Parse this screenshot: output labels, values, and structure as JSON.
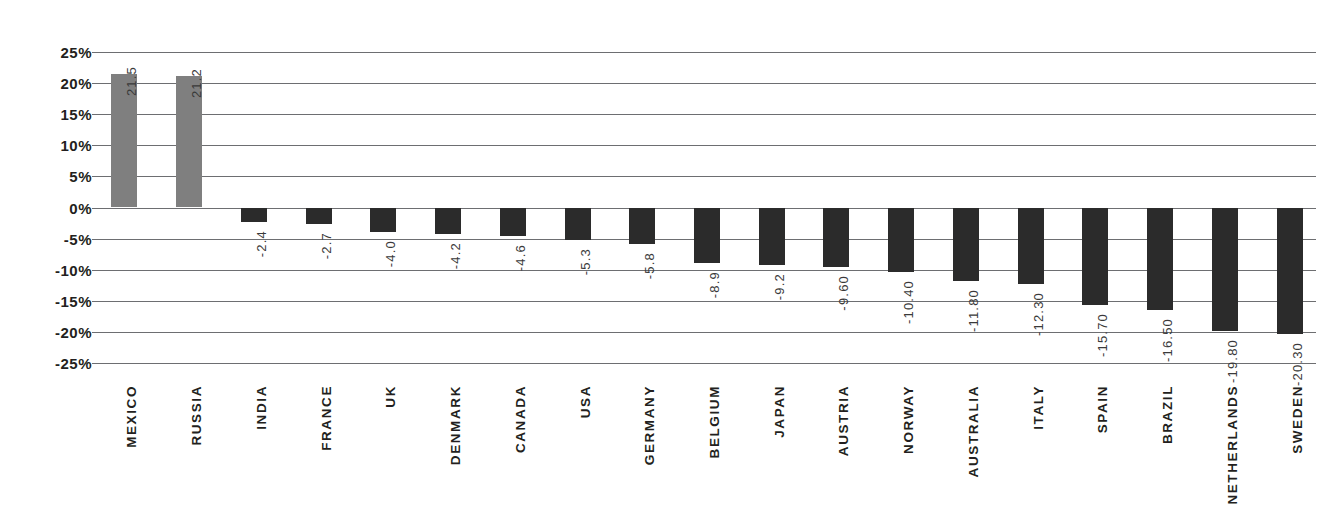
{
  "chart_data": {
    "type": "bar",
    "title": "",
    "subtitle": "",
    "xlabel": "",
    "ylabel": "",
    "ylim": [
      -25,
      25
    ],
    "y_tick_step": 5,
    "y_tick_labels": [
      "25%",
      "20%",
      "15%",
      "10%",
      "5%",
      "0%",
      "-5%",
      "-10%",
      "-15%",
      "-20%",
      "-25%"
    ],
    "y_tick_values": [
      25,
      20,
      15,
      10,
      5,
      0,
      -5,
      -10,
      -15,
      -20,
      -25
    ],
    "grid": true,
    "legend": "none",
    "orientation": "vertical",
    "categories": [
      "MEXICO",
      "RUSSIA",
      "INDIA",
      "FRANCE",
      "UK",
      "DENMARK",
      "CANADA",
      "USA",
      "GERMANY",
      "BELGIUM",
      "JAPAN",
      "AUSTRIA",
      "NORWAY",
      "AUSTRALIA",
      "ITALY",
      "SPAIN",
      "BRAZIL",
      "NETHERLANDS",
      "SWEDEN"
    ],
    "values": [
      21.5,
      21.2,
      -2.4,
      -2.7,
      -4.0,
      -4.2,
      -4.6,
      -5.3,
      -5.8,
      -8.9,
      -9.2,
      -9.6,
      -10.4,
      -11.8,
      -12.3,
      -15.7,
      -16.5,
      -19.8,
      -20.3
    ],
    "data_labels": [
      "21.5",
      "21.2",
      "-2.4",
      "-2.7",
      "-4.0",
      "-4.2",
      "-4.6",
      "-5.3",
      "-5.8",
      "-8.9",
      "-9.2",
      "-9.60",
      "-10.40",
      "-11.80",
      "-12.30",
      "-15.70",
      "-16.50",
      "-19.80",
      "-20.30"
    ],
    "bar_colors": [
      "#7f7f7f",
      "#7f7f7f",
      "#2b2b2b",
      "#2b2b2b",
      "#2b2b2b",
      "#2b2b2b",
      "#2b2b2b",
      "#2b2b2b",
      "#2b2b2b",
      "#2b2b2b",
      "#2b2b2b",
      "#2b2b2b",
      "#2b2b2b",
      "#2b2b2b",
      "#2b2b2b",
      "#2b2b2b",
      "#2b2b2b",
      "#2b2b2b",
      "#2b2b2b"
    ],
    "colors": {
      "positive_bar": "#7f7f7f",
      "negative_bar": "#2b2b2b",
      "gridline": "#6d6e71",
      "axis_text": "#231f20",
      "value_text": "#3a3a3a",
      "background": "#ffffff"
    }
  }
}
